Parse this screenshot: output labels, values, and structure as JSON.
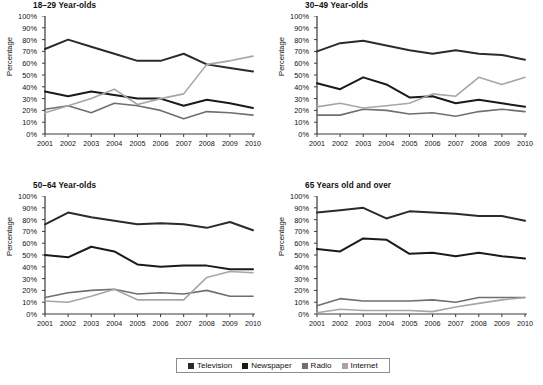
{
  "figure": {
    "width": 543,
    "height": 385,
    "background": "#ffffff",
    "caption": ""
  },
  "legend": {
    "position": "bottom-center",
    "items": [
      {
        "label": "Television",
        "color": "#2b2b2b"
      },
      {
        "label": "Newspaper",
        "color": "#1a1a1a"
      },
      {
        "label": "Radio",
        "color": "#6f6f6f"
      },
      {
        "label": "Internet",
        "color": "#a6a6a6"
      }
    ]
  },
  "axes": {
    "ylabel": "Percentage",
    "yticks": [
      "0%",
      "10%",
      "20%",
      "30%",
      "40%",
      "50%",
      "60%",
      "70%",
      "80%",
      "90%",
      "100%"
    ],
    "ytick_values": [
      0,
      10,
      20,
      30,
      40,
      50,
      60,
      70,
      80,
      90,
      100
    ],
    "ylim": [
      0,
      100
    ],
    "xticks": [
      "2001",
      "2002",
      "2003",
      "2004",
      "2005",
      "2006",
      "2007",
      "2008",
      "2009",
      "2010"
    ],
    "xlim": [
      2001,
      2010
    ],
    "grid": false
  },
  "chart_data": [
    {
      "type": "line",
      "title": "18–29 Year-olds",
      "xlabel": "",
      "ylabel": "Percentage",
      "ylim": [
        0,
        100
      ],
      "grid": false,
      "x": [
        2001,
        2002,
        2003,
        2004,
        2005,
        2006,
        2007,
        2008,
        2009,
        2010
      ],
      "categories": [
        "2001",
        "2002",
        "2003",
        "2004",
        "2005",
        "2006",
        "2007",
        "2008",
        "2009",
        "2010"
      ],
      "series": [
        {
          "name": "Television",
          "color": "#2b2b2b",
          "width": 2.0,
          "values": [
            72,
            80,
            74,
            68,
            62,
            62,
            68,
            59,
            56,
            53
          ]
        },
        {
          "name": "Newspaper",
          "color": "#1a1a1a",
          "width": 2.0,
          "values": [
            36,
            32,
            36,
            33,
            30,
            30,
            24,
            29,
            26,
            22
          ]
        },
        {
          "name": "Radio",
          "color": "#6f6f6f",
          "width": 1.6,
          "values": [
            21,
            24,
            18,
            26,
            24,
            20,
            13,
            19,
            18,
            16
          ]
        },
        {
          "name": "Internet",
          "color": "#a6a6a6",
          "width": 1.6,
          "values": [
            18,
            24,
            30,
            38,
            25,
            30,
            34,
            59,
            62,
            66
          ]
        }
      ]
    },
    {
      "type": "line",
      "title": "30–49 Year-olds",
      "xlabel": "",
      "ylabel": "Percentage",
      "ylim": [
        0,
        100
      ],
      "grid": false,
      "x": [
        2001,
        2002,
        2003,
        2004,
        2005,
        2006,
        2007,
        2008,
        2009,
        2010
      ],
      "categories": [
        "2001",
        "2002",
        "2003",
        "2004",
        "2005",
        "2006",
        "2007",
        "2008",
        "2009",
        "2010"
      ],
      "series": [
        {
          "name": "Television",
          "color": "#2b2b2b",
          "width": 2.0,
          "values": [
            70,
            77,
            79,
            75,
            71,
            68,
            71,
            68,
            67,
            63
          ]
        },
        {
          "name": "Newspaper",
          "color": "#1a1a1a",
          "width": 2.0,
          "values": [
            43,
            38,
            48,
            42,
            31,
            32,
            26,
            29,
            26,
            23
          ]
        },
        {
          "name": "Radio",
          "color": "#6f6f6f",
          "width": 1.6,
          "values": [
            16,
            16,
            21,
            20,
            17,
            18,
            15,
            19,
            21,
            19
          ]
        },
        {
          "name": "Internet",
          "color": "#a6a6a6",
          "width": 1.6,
          "values": [
            23,
            26,
            22,
            24,
            26,
            34,
            32,
            48,
            42,
            48
          ]
        }
      ]
    },
    {
      "type": "line",
      "title": "50–64 Year-olds",
      "xlabel": "",
      "ylabel": "Percentage",
      "ylim": [
        0,
        100
      ],
      "grid": false,
      "x": [
        2001,
        2002,
        2003,
        2004,
        2005,
        2006,
        2007,
        2008,
        2009,
        2010
      ],
      "categories": [
        "2001",
        "2002",
        "2003",
        "2004",
        "2005",
        "2006",
        "2007",
        "2008",
        "2009",
        "2010"
      ],
      "series": [
        {
          "name": "Television",
          "color": "#2b2b2b",
          "width": 2.0,
          "values": [
            76,
            86,
            82,
            79,
            76,
            77,
            76,
            73,
            78,
            71
          ]
        },
        {
          "name": "Newspaper",
          "color": "#1a1a1a",
          "width": 2.0,
          "values": [
            50,
            48,
            57,
            53,
            42,
            40,
            41,
            41,
            38,
            38
          ]
        },
        {
          "name": "Radio",
          "color": "#6f6f6f",
          "width": 1.6,
          "values": [
            14,
            18,
            20,
            21,
            17,
            18,
            17,
            20,
            15,
            15
          ]
        },
        {
          "name": "Internet",
          "color": "#a6a6a6",
          "width": 1.6,
          "values": [
            11,
            10,
            15,
            21,
            12,
            12,
            12,
            31,
            36,
            35
          ]
        }
      ]
    },
    {
      "type": "line",
      "title": "65 Years old and over",
      "xlabel": "",
      "ylabel": "Percentage",
      "ylim": [
        0,
        100
      ],
      "grid": false,
      "x": [
        2001,
        2002,
        2003,
        2004,
        2005,
        2006,
        2007,
        2008,
        2009,
        2010
      ],
      "categories": [
        "2001",
        "2002",
        "2003",
        "2004",
        "2005",
        "2006",
        "2007",
        "2008",
        "2009",
        "2010"
      ],
      "series": [
        {
          "name": "Television",
          "color": "#2b2b2b",
          "width": 2.0,
          "values": [
            86,
            88,
            90,
            81,
            87,
            86,
            85,
            83,
            83,
            79
          ]
        },
        {
          "name": "Newspaper",
          "color": "#1a1a1a",
          "width": 2.0,
          "values": [
            55,
            53,
            64,
            63,
            51,
            52,
            49,
            52,
            49,
            47
          ]
        },
        {
          "name": "Radio",
          "color": "#6f6f6f",
          "width": 1.6,
          "values": [
            7,
            13,
            11,
            11,
            11,
            12,
            10,
            14,
            14,
            14
          ]
        },
        {
          "name": "Internet",
          "color": "#a6a6a6",
          "width": 1.6,
          "values": [
            1,
            4,
            3,
            3,
            3,
            2,
            6,
            9,
            12,
            14
          ]
        }
      ]
    }
  ]
}
